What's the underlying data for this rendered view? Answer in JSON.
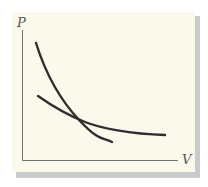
{
  "diagram": {
    "type": "pv-diagram",
    "axes": {
      "y_label": "P",
      "x_label": "V"
    },
    "curves": [
      {
        "name": "steep-curve",
        "description": "steeper decreasing curve (e.g. adiabat)"
      },
      {
        "name": "shallow-curve",
        "description": "shallower decreasing curve (e.g. isotherm)"
      }
    ],
    "colors": {
      "background": "#fbf8ec",
      "axis": "#707070",
      "curve": "#2e2e2e",
      "shadow": "#c9cbcc"
    }
  }
}
